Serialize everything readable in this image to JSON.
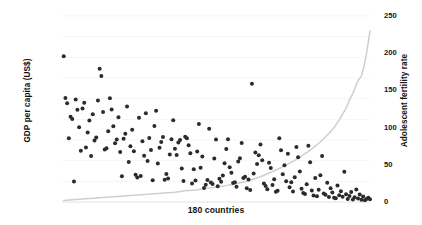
{
  "chart_data": {
    "type": "scatter",
    "title": "",
    "xlabel": "180 countries",
    "grid": true,
    "legend": "none",
    "axes": {
      "left": {
        "label": "GDP per capita (US$)",
        "ticks": [
          "0",
          "10,000",
          "20,000",
          "30,000",
          "40,000",
          "50,000",
          "60,000",
          "70,000",
          "80,000",
          "90,000"
        ],
        "tick_values": [
          0,
          10000,
          20000,
          30000,
          40000,
          50000,
          60000,
          70000,
          80000,
          90000
        ],
        "ylim": [
          0,
          90000
        ]
      },
      "right": {
        "label": "Adolescent fertility rate",
        "ticks": [
          "0",
          "50",
          "100",
          "150",
          "200",
          "250"
        ],
        "tick_values": [
          0,
          50,
          100,
          150,
          200,
          250
        ],
        "ylim": [
          0,
          250
        ]
      },
      "x": {
        "label": "180 countries",
        "ticks": [],
        "xlim": [
          0,
          180
        ]
      }
    },
    "series": [
      {
        "name": "GDP per capita (US$)",
        "type": "scatter",
        "axis": "left",
        "color": "#2b2b2b",
        "marker_size": 2.0,
        "x": [
          1,
          2,
          3,
          4,
          5,
          6,
          7,
          8,
          9,
          10,
          11,
          12,
          13,
          14,
          15,
          16,
          17,
          18,
          19,
          20,
          21,
          22,
          23,
          24,
          25,
          26,
          27,
          28,
          29,
          30,
          31,
          32,
          33,
          34,
          35,
          36,
          37,
          38,
          39,
          40,
          41,
          42,
          43,
          44,
          45,
          46,
          47,
          48,
          49,
          50,
          51,
          52,
          53,
          54,
          55,
          56,
          57,
          58,
          59,
          60,
          61,
          62,
          63,
          64,
          65,
          66,
          67,
          68,
          69,
          70,
          71,
          72,
          73,
          74,
          75,
          76,
          77,
          78,
          79,
          80,
          81,
          82,
          83,
          84,
          85,
          86,
          87,
          88,
          89,
          90,
          91,
          92,
          93,
          94,
          95,
          96,
          97,
          98,
          99,
          100,
          101,
          102,
          103,
          104,
          105,
          106,
          107,
          108,
          109,
          110,
          111,
          112,
          113,
          114,
          115,
          116,
          117,
          118,
          119,
          120,
          121,
          122,
          123,
          124,
          125,
          126,
          127,
          128,
          129,
          130,
          131,
          132,
          133,
          134,
          135,
          136,
          137,
          138,
          139,
          140,
          141,
          142,
          143,
          144,
          145,
          146,
          147,
          148,
          149,
          150,
          151,
          152,
          153,
          154,
          155,
          156,
          157,
          158,
          159,
          160,
          161,
          162,
          163,
          164,
          165,
          166,
          167,
          168,
          169,
          170,
          171,
          172,
          173,
          174,
          175,
          176,
          177,
          178,
          179,
          180
        ],
        "y": [
          70500,
          50300,
          47800,
          30800,
          41200,
          40200,
          9900,
          49600,
          44600,
          36200,
          24800,
          45200,
          48000,
          26400,
          33600,
          39400,
          22200,
          42400,
          29800,
          31200,
          49100,
          64500,
          61000,
          43600,
          25400,
          26000,
          34200,
          50200,
          44800,
          36600,
          28400,
          30200,
          41000,
          24200,
          12400,
          30600,
          33000,
          46200,
          19400,
          27000,
          35000,
          24600,
          13200,
          11800,
          40800,
          12600,
          29400,
          22400,
          43000,
          19800,
          31000,
          25200,
          10500,
          36800,
          44200,
          18600,
          26200,
          29000,
          31400,
          10800,
          13600,
          11400,
          23000,
          30400,
          39600,
          25800,
          22800,
          28800,
          30000,
          16200,
          10200,
          31600,
          30800,
          27400,
          23600,
          8900,
          15800,
          10400,
          24400,
          37800,
          16600,
          22000,
          6800,
          8400,
          10600,
          35400,
          9400,
          8700,
          21000,
          30200,
          7600,
          11200,
          9800,
          12800,
          18800,
          25600,
          30400,
          16800,
          14200,
          9200,
          9600,
          7400,
          19600,
          21200,
          28600,
          11600,
          12200,
          6600,
          10900,
          5800,
          57200,
          13800,
          24000,
          18400,
          22600,
          27800,
          20200,
          9000,
          7800,
          6200,
          19000,
          16400,
          8200,
          11000,
          4900,
          5400,
          30800,
          25000,
          13400,
          17800,
          10100,
          23400,
          7100,
          9600,
          5100,
          12000,
          26600,
          21600,
          14800,
          6400,
          4300,
          3900,
          8600,
          27200,
          19200,
          5600,
          3100,
          11600,
          2800,
          5900,
          13000,
          22200,
          4100,
          3500,
          9300,
          2400,
          6700,
          4600,
          2100,
          1800,
          8000,
          3300,
          5200,
          2600,
          14600,
          3800,
          1500,
          2900,
          4800,
          1200,
          2300,
          6100,
          1700,
          3600,
          1100,
          2700,
          900,
          1400,
          2000,
          1300
        ],
        "note": "Each point = one country; GDP per capita in US$, countries sorted along x by adolescent fertility rate (ascending)."
      },
      {
        "name": "Adolescent fertility rate",
        "type": "line",
        "axis": "right",
        "color": "#cfcfcf",
        "x": [
          1,
          6,
          12,
          18,
          24,
          30,
          36,
          42,
          48,
          54,
          60,
          66,
          72,
          78,
          84,
          90,
          96,
          102,
          108,
          112,
          116,
          120,
          124,
          128,
          132,
          136,
          140,
          144,
          148,
          152,
          156,
          159,
          162,
          164,
          166,
          168,
          170,
          171,
          172,
          173,
          174,
          175,
          176,
          177,
          178,
          179,
          180
        ],
        "y": [
          2,
          3,
          4,
          5,
          6,
          7,
          8,
          9,
          10,
          11,
          12,
          13,
          15,
          16,
          18,
          20,
          22,
          25,
          28,
          31,
          34,
          38,
          42,
          46,
          51,
          56,
          62,
          68,
          75,
          83,
          92,
          100,
          110,
          118,
          126,
          137,
          146,
          152,
          158,
          163,
          166,
          170,
          178,
          188,
          200,
          215,
          230
        ],
        "note": "Births per 1,000 women ages 15-19; monotonically increasing, steep rise at far right."
      }
    ]
  }
}
